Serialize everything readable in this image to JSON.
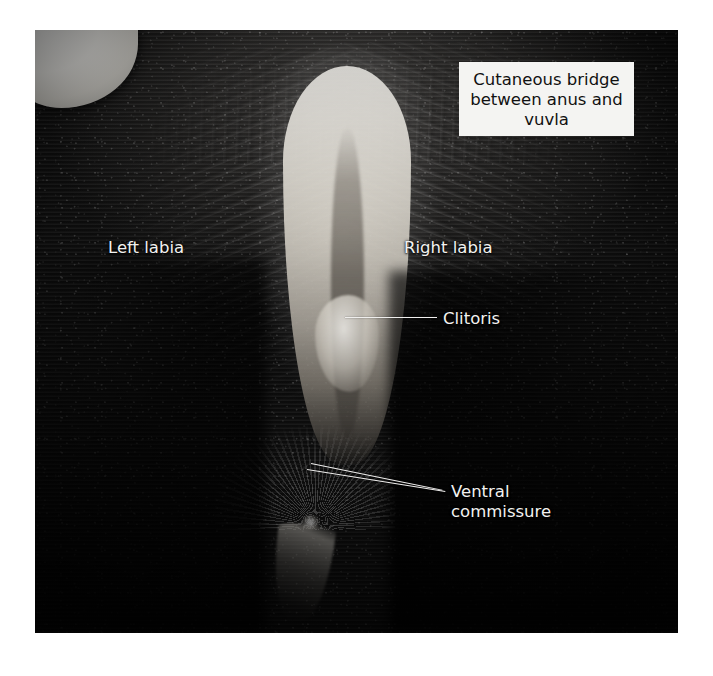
{
  "figure": {
    "photo_description": "Black-and-white close-up photograph of the perineal region of a dark-coated cow showing the vulva, labia and surrounding hair",
    "background_color": "#ffffff",
    "photo_bounds": {
      "x": 35,
      "y": 30,
      "width": 643,
      "height": 603
    }
  },
  "annotations": {
    "cutaneous_bridge": {
      "text": "Cutaneous bridge\nbetween anus and\nvuvla",
      "style": "boxed",
      "text_color": "#111111",
      "box_color": "#f4f4f2",
      "position": {
        "x": 459,
        "y": 62,
        "width": 175,
        "height": 74
      }
    },
    "left_labia": {
      "text": "Left labia",
      "style": "plain-white",
      "text_color": "#f2f2f0",
      "position": {
        "x": 108,
        "y": 238
      }
    },
    "right_labia": {
      "text": "Right labia",
      "style": "plain-white",
      "text_color": "#f2f2f0",
      "position": {
        "x": 404,
        "y": 238
      }
    },
    "clitoris": {
      "text": "Clitoris",
      "style": "plain-white-with-leader",
      "text_color": "#f2f2f0",
      "position": {
        "x": 443,
        "y": 309
      },
      "leader": {
        "x": 345,
        "y": 317,
        "length": 92,
        "angle": 0
      }
    },
    "ventral_commissure": {
      "text": "Ventral\ncommissure",
      "style": "plain-white-with-leader",
      "text_color": "#f2f2f0",
      "position": {
        "x": 451,
        "y": 482
      },
      "leaders": [
        {
          "x": 311,
          "y": 463,
          "length": 134,
          "angle": 11.5
        },
        {
          "x": 307,
          "y": 469,
          "length": 140,
          "angle": 9.0
        }
      ]
    }
  }
}
